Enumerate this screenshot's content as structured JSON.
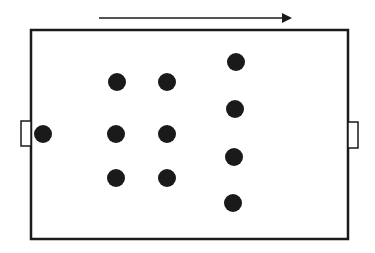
{
  "diagram": {
    "type": "soccer-formation",
    "colors": {
      "line": "#1a1a1a",
      "player": "#1a1a1a",
      "background": "#ffffff"
    },
    "direction_arrow": {
      "x1": 99,
      "y1": 18,
      "x2": 290,
      "y2": 18,
      "meaning": "direction of attack (left to right)"
    },
    "field": {
      "x": 31,
      "y": 30,
      "width": 317,
      "height": 209
    },
    "goals": [
      {
        "side": "left",
        "x": 21,
        "y": 121,
        "width": 10,
        "height": 25
      },
      {
        "side": "right",
        "x": 348,
        "y": 122,
        "width": 10,
        "height": 26
      }
    ],
    "formation": "1-3-3-4",
    "players": [
      {
        "role": "goalkeeper",
        "cx": 43,
        "cy": 134
      },
      {
        "role": "defender",
        "cx": 117,
        "cy": 82
      },
      {
        "role": "defender",
        "cx": 116,
        "cy": 134
      },
      {
        "role": "defender",
        "cx": 116,
        "cy": 178
      },
      {
        "role": "midfielder",
        "cx": 167,
        "cy": 82
      },
      {
        "role": "midfielder",
        "cx": 167,
        "cy": 134
      },
      {
        "role": "midfielder",
        "cx": 167,
        "cy": 178
      },
      {
        "role": "forward",
        "cx": 236,
        "cy": 62
      },
      {
        "role": "forward",
        "cx": 235,
        "cy": 109
      },
      {
        "role": "forward",
        "cx": 234,
        "cy": 157
      },
      {
        "role": "forward",
        "cx": 233,
        "cy": 203
      }
    ],
    "player_radius": 9
  }
}
